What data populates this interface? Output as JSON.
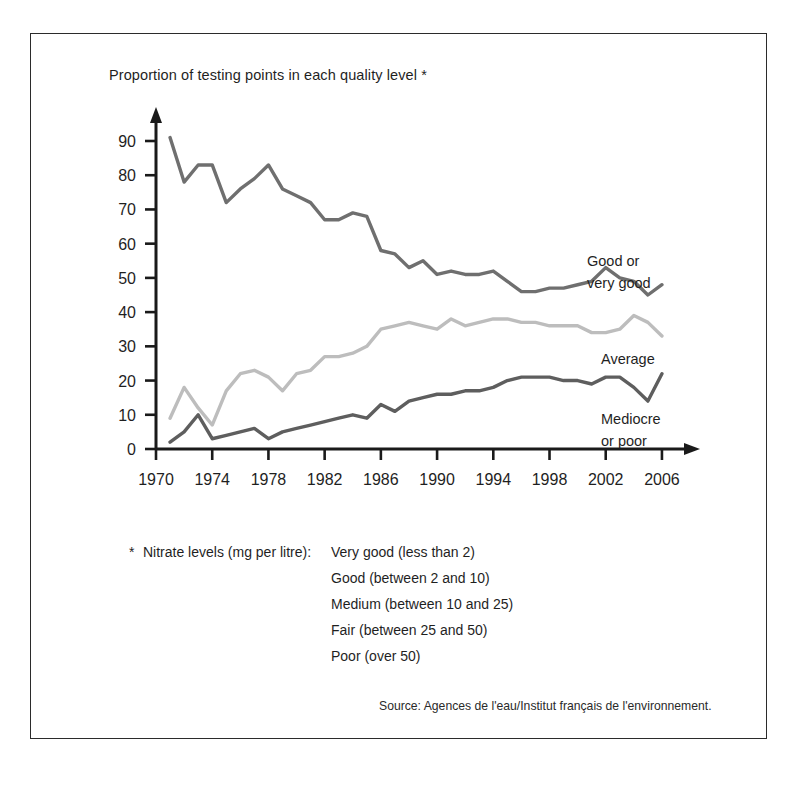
{
  "figure": {
    "title": "Proportion of testing points in each quality level *",
    "source": "Source: Agences de l'eau/Institut français de l'environnement.",
    "frame_color": "#2b2b2b",
    "background": "#ffffff"
  },
  "footnote": {
    "marker": "*",
    "key": "Nitrate levels (mg per litre):",
    "values": [
      "Very good (less than 2)",
      "Good (between 2 and 10)",
      "Medium (between 10 and 25)",
      "Fair (between 25 and 50)",
      "Poor (over 50)"
    ]
  },
  "chart_data": {
    "type": "line",
    "title": "Proportion of testing points in each quality level *",
    "xlabel": "",
    "ylabel": "",
    "xlim": [
      1970,
      2007
    ],
    "ylim": [
      0,
      95
    ],
    "grid": false,
    "legend_position": "inline-right",
    "y_ticks": [
      0,
      10,
      20,
      30,
      40,
      50,
      60,
      70,
      80,
      90
    ],
    "x_ticks": [
      1970,
      1974,
      1978,
      1982,
      1986,
      1990,
      1994,
      1998,
      2002,
      2006
    ],
    "x": [
      1971,
      1972,
      1973,
      1974,
      1975,
      1976,
      1977,
      1978,
      1979,
      1980,
      1981,
      1982,
      1983,
      1984,
      1985,
      1986,
      1987,
      1988,
      1989,
      1990,
      1991,
      1992,
      1993,
      1994,
      1995,
      1996,
      1997,
      1998,
      1999,
      2000,
      2001,
      2002,
      2003,
      2004,
      2005,
      2006
    ],
    "series": [
      {
        "name": "Good or very good",
        "color": "#6f6f6f",
        "label": "Good or\nvery good",
        "label_lines": [
          "Good or",
          "very good"
        ],
        "values": [
          91,
          78,
          83,
          83,
          72,
          76,
          79,
          83,
          76,
          74,
          72,
          67,
          67,
          69,
          68,
          58,
          57,
          53,
          55,
          51,
          52,
          51,
          51,
          52,
          49,
          46,
          46,
          47,
          47,
          48,
          49,
          53,
          50,
          49,
          45,
          48
        ]
      },
      {
        "name": "Average",
        "color": "#bdbdbd",
        "label": "Average",
        "label_lines": [
          "Average"
        ],
        "values": [
          9,
          18,
          12,
          7,
          17,
          22,
          23,
          21,
          17,
          22,
          23,
          27,
          27,
          28,
          30,
          35,
          36,
          37,
          36,
          35,
          38,
          36,
          37,
          38,
          38,
          37,
          37,
          36,
          36,
          36,
          34,
          34,
          35,
          39,
          37,
          33
        ]
      },
      {
        "name": "Mediocre or poor",
        "color": "#5e5e5e",
        "label": "Mediocre\nor poor",
        "label_lines": [
          "Mediocre",
          "or poor"
        ],
        "values": [
          2,
          5,
          10,
          3,
          4,
          5,
          6,
          3,
          5,
          6,
          7,
          8,
          9,
          10,
          9,
          13,
          11,
          14,
          15,
          16,
          16,
          17,
          17,
          18,
          20,
          21,
          21,
          21,
          20,
          20,
          19,
          21,
          21,
          18,
          14,
          22
        ]
      }
    ]
  },
  "axes": {
    "y_tick_labels": [
      "90",
      "80",
      "70",
      "60",
      "50",
      "40",
      "30",
      "20",
      "10",
      "0"
    ],
    "x_tick_labels": [
      "1970",
      "1974",
      "1978",
      "1982",
      "1986",
      "1990",
      "1994",
      "1998",
      "2002",
      "2006"
    ],
    "axis_color": "#1a1a1a"
  }
}
